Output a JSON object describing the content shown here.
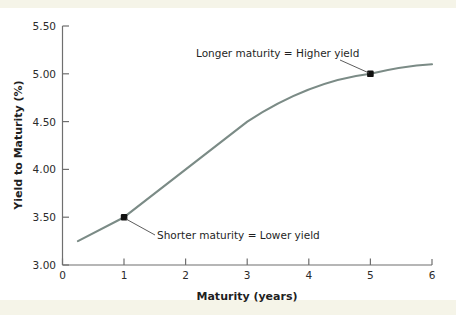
{
  "chart_data": {
    "type": "line",
    "title": "",
    "xlabel": "Maturity (years)",
    "ylabel": "Yield to Maturity (%)",
    "xlim": [
      0,
      6
    ],
    "ylim": [
      3.0,
      5.5
    ],
    "grid": false,
    "legend": "none",
    "line_color": "#7b8b86",
    "marker_color": "#111111",
    "xticks": [
      "0",
      "1",
      "2",
      "3",
      "4",
      "5",
      "6"
    ],
    "xtick_values": [
      0,
      1,
      2,
      3,
      4,
      5,
      6
    ],
    "yticks": [
      "3.00",
      "3.50",
      "4.00",
      "4.50",
      "5.00",
      "5.50"
    ],
    "ytick_values": [
      3.0,
      3.5,
      4.0,
      4.5,
      5.0,
      5.5
    ],
    "series": [
      {
        "name": "Yield curve",
        "x": [
          0.25,
          1.0,
          3.0,
          5.0,
          6.0
        ],
        "values": [
          3.25,
          3.5,
          4.5,
          5.0,
          5.1
        ]
      }
    ],
    "markers": [
      {
        "label": "short-maturity-point",
        "x": 1,
        "y": 3.5
      },
      {
        "label": "long-maturity-point",
        "x": 5,
        "y": 5.0
      }
    ],
    "annotations": [
      {
        "name": "longer-maturity-annotation",
        "text": "Longer maturity = Higher yield",
        "target_x": 5,
        "target_y": 5.0
      },
      {
        "name": "shorter-maturity-annotation",
        "text": "Shorter maturity = Lower yield",
        "target_x": 1,
        "target_y": 3.5
      }
    ]
  },
  "colors": {
    "page_background": "#f5f4e8",
    "plot_background": "#ffffff",
    "axis": "#6f6f6f",
    "text": "#1f1f1f",
    "curve": "#7b8b86"
  },
  "y_tick_labels": {
    "t0": "5.50",
    "t1": "5.00",
    "t2": "4.50",
    "t3": "4.00",
    "t4": "3.50",
    "t5": "3.00"
  },
  "x_tick_labels": {
    "t0": "0",
    "t1": "1",
    "t2": "2",
    "t3": "3",
    "t4": "4",
    "t5": "5",
    "t6": "6"
  },
  "axis_titles": {
    "x": "Maturity (years)",
    "y": "Yield to Maturity (%)"
  },
  "annotation_labels": {
    "upper": "Longer maturity = Higher yield",
    "lower": "Shorter maturity = Lower yield"
  }
}
